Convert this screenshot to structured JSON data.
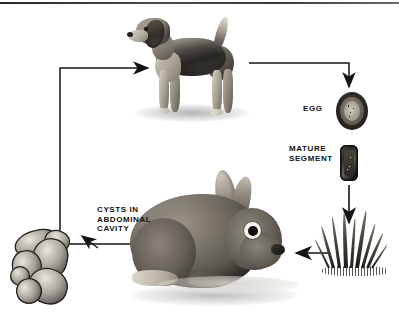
{
  "diagram": {
    "type": "life-cycle",
    "background_color": "#ffffff",
    "line_color": "#1a1a1a",
    "labels": [
      {
        "id": "egg",
        "text": "EGG"
      },
      {
        "id": "mature_segment",
        "text": "MATURE\nSEGMENT"
      },
      {
        "id": "cysts",
        "text": "CYSTS  IN\nABDOMINAL\nCAVITY"
      }
    ],
    "nodes": [
      {
        "id": "dog",
        "name": "dog-illustration",
        "caption": ""
      },
      {
        "id": "egg",
        "name": "egg-illustration",
        "caption": "EGG"
      },
      {
        "id": "segment",
        "name": "mature-segment-illustration",
        "caption": "MATURE SEGMENT"
      },
      {
        "id": "grass",
        "name": "grass-illustration",
        "caption": ""
      },
      {
        "id": "rabbit",
        "name": "rabbit-illustration",
        "caption": ""
      },
      {
        "id": "cysts",
        "name": "cysts-illustration",
        "caption": "CYSTS IN ABDOMINAL CAVITY"
      }
    ],
    "arrows": [
      {
        "from": "cysts",
        "to": "dog"
      },
      {
        "from": "dog",
        "to": "egg"
      },
      {
        "from": "segment",
        "to": "grass"
      },
      {
        "from": "grass",
        "to": "rabbit"
      },
      {
        "from": "cysts",
        "to": "rabbit"
      }
    ]
  }
}
